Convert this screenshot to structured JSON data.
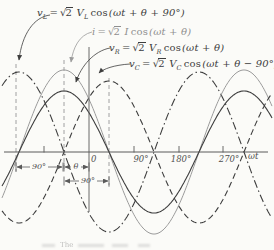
{
  "figure": {
    "bg": "#fbfbf8",
    "ink": "#3d3d3d",
    "muted_ink": "#8f8f8f",
    "axis_color": "#5a5a5a",
    "guide_color": "#8a8a8a"
  },
  "chart_data": {
    "type": "line",
    "title": "",
    "xlabel": "ωt",
    "x_tick_labels": [
      "0",
      "90°",
      "180°",
      "270°"
    ],
    "theta_deg_estimated": 50,
    "series": [
      {
        "name": "vL",
        "label": "v_L = √2 V_L cos(ωt + θ + 90°)",
        "phase_deg": 140,
        "amplitude_px": 80,
        "style": "dashdot",
        "color": "#3d3d3d",
        "width": 1.1
      },
      {
        "name": "i",
        "label": "i = √2 I cos(ωt + θ)",
        "phase_deg": 50,
        "amplitude_px": 82,
        "style": "solid",
        "color": "#9b9b9b",
        "width": 1.0
      },
      {
        "name": "vR",
        "label": "v_R = √2 V_R cos(ωt + θ)",
        "phase_deg": 50,
        "amplitude_px": 61,
        "style": "solid",
        "color": "#3d3d3d",
        "width": 1.1
      },
      {
        "name": "vC",
        "label": "v_C = √2 V_C cos(ωt + θ − 90°)",
        "phase_deg": -40,
        "amplitude_px": 71,
        "style": "dashed",
        "color": "#3d3d3d",
        "width": 1.1
      }
    ],
    "geometry": {
      "x0": 89,
      "px_per_90deg": 45,
      "y0": 152,
      "x_min": 2,
      "x_max": 272
    }
  },
  "formulas": {
    "vl": {
      "v": "v",
      "vsub": "L",
      "eq": "=",
      "root": "√",
      "rad": "2",
      "coef": "V",
      "csub": "L",
      "fn": "cos",
      "arg": "(ωt + θ + 90°)"
    },
    "i": {
      "v": "i",
      "vsub": "",
      "eq": "=",
      "root": "√",
      "rad": "2",
      "coef": "I",
      "csub": "",
      "fn": "cos",
      "arg": "(ωt + θ)"
    },
    "vr": {
      "v": "v",
      "vsub": "R",
      "eq": "=",
      "root": "√",
      "rad": "2",
      "coef": "V",
      "csub": "R",
      "fn": "cos",
      "arg": "(ωt + θ)"
    },
    "vc": {
      "v": "v",
      "vsub": "C",
      "eq": "=",
      "root": "√",
      "rad": "2",
      "coef": "V",
      "csub": "C",
      "fn": "cos",
      "arg": "(ωt + θ − 90°)"
    }
  },
  "axis": {
    "zero_label": "0",
    "tick_labels": [
      {
        "text": "90°"
      },
      {
        "text": "180°"
      },
      {
        "text": "270°"
      }
    ],
    "x_axis_label": "ωt"
  },
  "svg": {
    "axis": {
      "y": 152,
      "x1": 4,
      "x2": 268
    },
    "y_axis": {
      "x": 89,
      "y1": 47,
      "y2": 212
    },
    "ticks": {
      "xs": [
        44,
        134,
        179,
        223
      ],
      "y1": 146,
      "y2": 152.5
    },
    "guides": [
      {
        "x": 16,
        "y1": 64,
        "y2": 172
      },
      {
        "x": 64,
        "y1": 60,
        "y2": 172
      },
      {
        "x": 109,
        "y1": 78,
        "y2": 187
      }
    ],
    "leaders": [
      {
        "name": "leader-vl",
        "d": "M50,15 C34,17 22,34 19,60",
        "color": "#3d3d3d"
      },
      {
        "name": "leader-i",
        "d": "M92,32 C79,35 73,48 71,62",
        "color": "#9b9b9b"
      },
      {
        "name": "leader-vr",
        "d": "M110,48 C94,51 81,66 76,82",
        "color": "#3d3d3d"
      },
      {
        "name": "leader-vc",
        "d": "M130,64 C114,65 103,69 99,73",
        "color": "#3d3d3d"
      }
    ],
    "dims": {
      "rows": [
        {
          "y": 167,
          "x1": 16,
          "x2": 63,
          "cx": 39,
          "half": 9,
          "label": "90°"
        },
        {
          "y": 167,
          "x1": 64,
          "x2": 89,
          "cx": 76,
          "half": 5,
          "label": "θ"
        },
        {
          "y": 181,
          "x1": 64,
          "x2": 109,
          "cx": 88,
          "half": 9,
          "label": "90°"
        }
      ]
    }
  },
  "caption": {
    "visible_word": "The"
  }
}
